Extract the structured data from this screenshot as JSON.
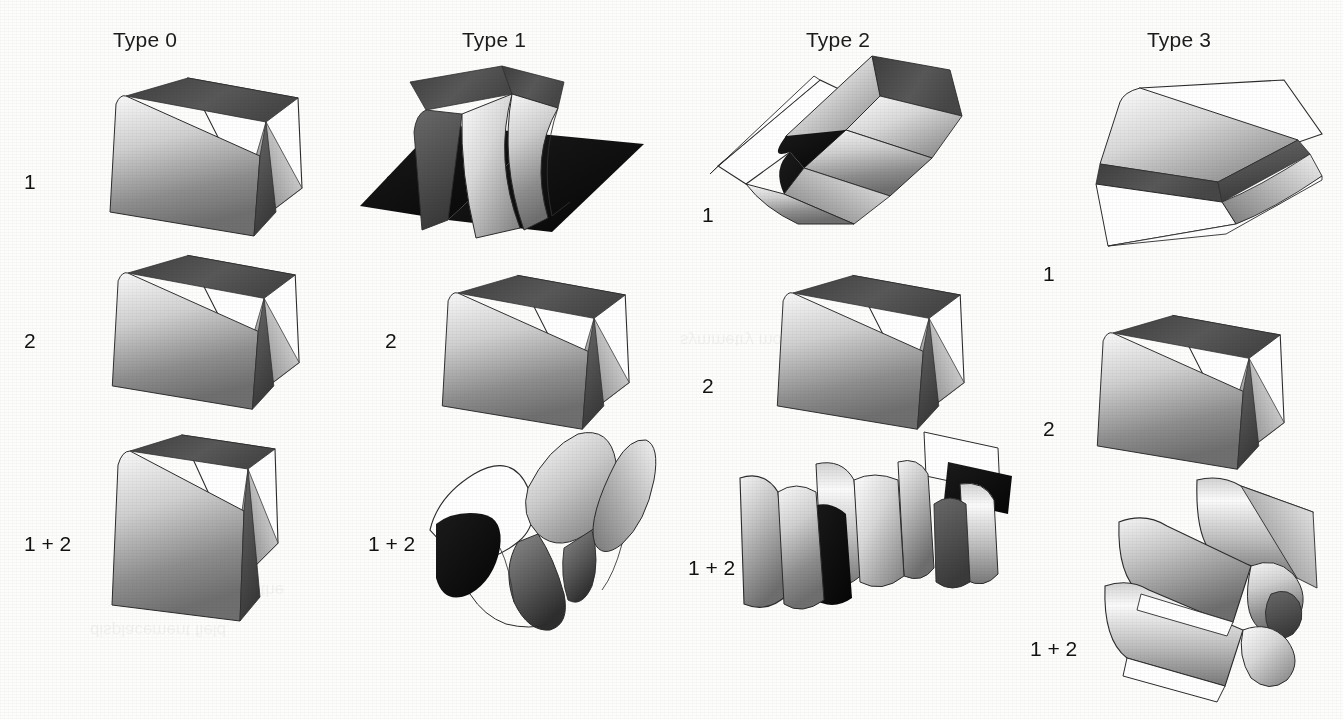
{
  "figure": {
    "background_color": "#fdfdfc",
    "ink_color": "#1b1b1b",
    "columns": [
      {
        "id": "type0",
        "label": "Type 0",
        "header_x": 113,
        "header_y": 28
      },
      {
        "id": "type1",
        "label": "Type 1",
        "header_x": 462,
        "header_y": 28
      },
      {
        "id": "type2",
        "label": "Type 2",
        "header_x": 806,
        "header_y": 28
      },
      {
        "id": "type3",
        "label": "Type 3",
        "header_x": 1147,
        "header_y": 28
      }
    ],
    "rows": [
      {
        "id": "mode1",
        "label": "1"
      },
      {
        "id": "mode2",
        "label": "2"
      },
      {
        "id": "mode1plus2",
        "label": "1 + 2"
      }
    ],
    "row_labels": [
      {
        "column": "type0",
        "row": "mode1",
        "text": "1",
        "x": 24,
        "y": 170
      },
      {
        "column": "type0",
        "row": "mode2",
        "text": "2",
        "x": 24,
        "y": 329
      },
      {
        "column": "type0",
        "row": "mode1plus2",
        "text": "1 + 2",
        "x": 24,
        "y": 532
      },
      {
        "column": "type1",
        "row": "mode1",
        "text": "1",
        "x": 385,
        "y": 170
      },
      {
        "column": "type1",
        "row": "mode2",
        "text": "2",
        "x": 385,
        "y": 329
      },
      {
        "column": "type1",
        "row": "mode1plus2",
        "text": "1 + 2",
        "x": 368,
        "y": 532
      },
      {
        "column": "type2",
        "row": "mode1",
        "text": "1",
        "x": 702,
        "y": 203
      },
      {
        "column": "type2",
        "row": "mode2",
        "text": "2",
        "x": 702,
        "y": 374
      },
      {
        "column": "type2",
        "row": "mode1plus2",
        "text": "1 + 2",
        "x": 688,
        "y": 556
      },
      {
        "column": "type3",
        "row": "mode1",
        "text": "1",
        "x": 1043,
        "y": 262
      },
      {
        "column": "type3",
        "row": "mode2",
        "text": "2",
        "x": 1043,
        "y": 417
      },
      {
        "column": "type3",
        "row": "mode1plus2",
        "text": "1 + 2",
        "x": 1030,
        "y": 637
      }
    ],
    "cells": [
      {
        "column": "type0",
        "row": "mode1",
        "shape": "tent-fold",
        "x": 70,
        "y": 60,
        "w": 250,
        "h": 170,
        "description": "single ridge fold, two shaded panels with dark back flap"
      },
      {
        "column": "type0",
        "row": "mode2",
        "shape": "tent-fold",
        "x": 70,
        "y": 235,
        "w": 250,
        "h": 170,
        "description": "single ridge fold, identical to mode 1"
      },
      {
        "column": "type0",
        "row": "mode1plus2",
        "shape": "tent-fold-tall",
        "x": 70,
        "y": 420,
        "w": 250,
        "h": 200,
        "description": "narrow double fold, superposition of modes 1 and 2"
      },
      {
        "column": "type1",
        "row": "mode1",
        "shape": "saddle-black",
        "x": 360,
        "y": 55,
        "w": 290,
        "h": 190,
        "description": "steep fold with two black side panels and bright central ridge"
      },
      {
        "column": "type1",
        "row": "mode2",
        "shape": "tent-fold",
        "x": 400,
        "y": 255,
        "w": 250,
        "h": 170,
        "description": "single ridge fold"
      },
      {
        "column": "type1",
        "row": "mode1plus2",
        "shape": "wave-corrugation",
        "x": 390,
        "y": 420,
        "w": 280,
        "h": 210,
        "description": "two-period wavy corrugation with dark troughs"
      },
      {
        "column": "type2",
        "row": "mode1",
        "shape": "flat-fold-top",
        "x": 700,
        "y": 50,
        "w": 290,
        "h": 190,
        "description": "low-angle fold seen from above, dark crease band"
      },
      {
        "column": "type2",
        "row": "mode2",
        "shape": "tent-fold",
        "x": 740,
        "y": 255,
        "w": 250,
        "h": 170,
        "description": "single ridge fold"
      },
      {
        "column": "type2",
        "row": "mode1plus2",
        "shape": "roll-corrugation",
        "x": 720,
        "y": 420,
        "w": 300,
        "h": 210,
        "description": "interleaved rolled corrugation with black underside"
      },
      {
        "column": "type3",
        "row": "mode1",
        "shape": "shallow-fold",
        "x": 1030,
        "y": 60,
        "w": 300,
        "h": 200,
        "description": "very shallow fold, almost flat plates"
      },
      {
        "column": "type3",
        "row": "mode2",
        "shape": "tent-fold",
        "x": 1060,
        "y": 295,
        "w": 250,
        "h": 170,
        "description": "single ridge fold"
      },
      {
        "column": "type3",
        "row": "mode1plus2",
        "shape": "roll-stack",
        "x": 1055,
        "y": 480,
        "w": 290,
        "h": 215,
        "description": "stacked rolled corrugation, bright tubes"
      }
    ],
    "palette": {
      "sheet_light": "#fbfbfb",
      "sheet_mid": "#9a9a9a",
      "sheet_dark": "#5d5d5d",
      "crease_dark": "#4a4a4a",
      "shadow_black": "#101010",
      "outline": "#2b2b2b"
    }
  }
}
